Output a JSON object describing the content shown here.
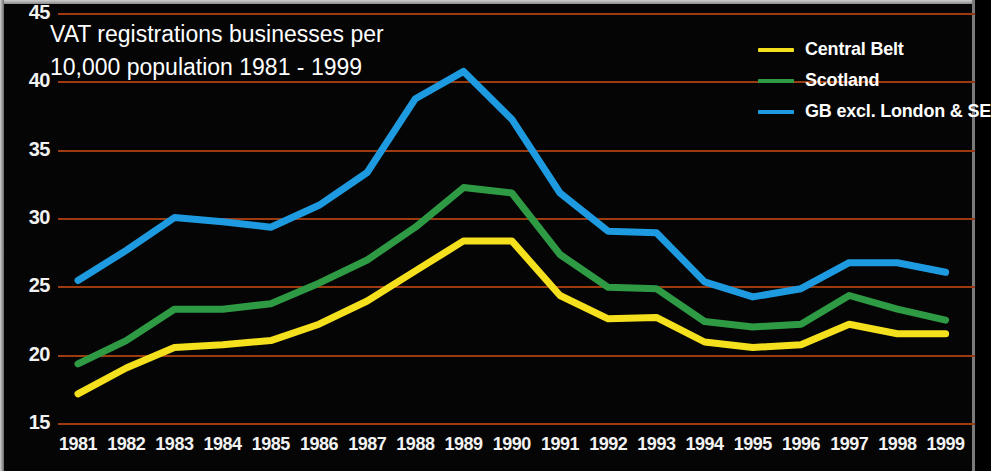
{
  "title": {
    "line1": "VAT registrations businesses per",
    "line2": "10,000 population 1981 - 1999"
  },
  "colors": {
    "background": "#050505",
    "gridline": "#9c3a10",
    "axis_text": "#f2f2f2",
    "central_belt": "#f5e01e",
    "scotland": "#2e9b44",
    "gb_excl_london_se": "#1e9be0"
  },
  "legend": {
    "position": "top-right",
    "items": [
      {
        "label": "Central Belt",
        "color": "#f5e01e"
      },
      {
        "label": "Scotland",
        "color": "#2e9b44"
      },
      {
        "label": "GB excl. London & SE",
        "color": "#1e9be0"
      }
    ]
  },
  "axes": {
    "y_ticks": [
      "45",
      "40",
      "35",
      "30",
      "25",
      "20",
      "15"
    ],
    "x_ticks": [
      "1981",
      "1982",
      "1983",
      "1984",
      "1985",
      "1986",
      "1987",
      "1988",
      "1989",
      "1990",
      "1991",
      "1992",
      "1993",
      "1994",
      "1995",
      "1996",
      "1997",
      "1998",
      "1999"
    ]
  },
  "chart_data": {
    "type": "line",
    "title": "VAT registrations businesses per 10,000 population 1981 - 1999",
    "xlabel": "",
    "ylabel": "",
    "ylim": [
      15,
      45
    ],
    "ytick_step": 5,
    "grid": true,
    "legend_position": "top-right",
    "x": [
      1981,
      1982,
      1983,
      1984,
      1985,
      1986,
      1987,
      1988,
      1989,
      1990,
      1991,
      1992,
      1993,
      1994,
      1995,
      1996,
      1997,
      1998,
      1999
    ],
    "series": [
      {
        "name": "Central Belt",
        "color": "#f5e01e",
        "values": [
          17.2,
          19.1,
          20.6,
          20.8,
          21.1,
          22.3,
          24.0,
          26.2,
          28.4,
          28.4,
          24.4,
          22.7,
          22.8,
          21.0,
          20.6,
          20.8,
          22.3,
          21.6,
          21.6
        ]
      },
      {
        "name": "Scotland",
        "color": "#2e9b44",
        "values": [
          19.4,
          21.1,
          23.4,
          23.4,
          23.8,
          25.3,
          27.0,
          29.4,
          32.3,
          31.9,
          27.4,
          25.0,
          24.9,
          22.5,
          22.1,
          22.3,
          24.4,
          23.4,
          22.6
        ]
      },
      {
        "name": "GB excl. London & SE",
        "color": "#1e9be0",
        "values": [
          25.5,
          27.7,
          30.1,
          29.8,
          29.4,
          31.0,
          33.4,
          38.8,
          40.8,
          37.3,
          31.9,
          29.1,
          29.0,
          25.4,
          24.3,
          24.9,
          26.8,
          26.8,
          26.1
        ]
      }
    ]
  }
}
